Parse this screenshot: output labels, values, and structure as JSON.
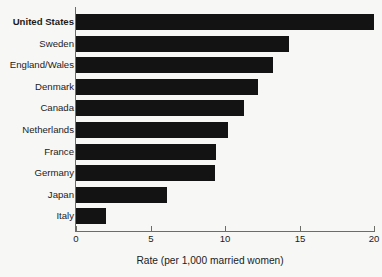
{
  "chart_data": {
    "type": "bar",
    "orientation": "horizontal",
    "title": "",
    "subtitle": "",
    "xlabel": "Rate (per 1,000 married women)",
    "ylabel": "",
    "xlim": [
      0,
      20
    ],
    "xticks": [
      0,
      5,
      10,
      15,
      20
    ],
    "xtick_labels": [
      "0",
      "5",
      "10",
      "15",
      "20"
    ],
    "grid": false,
    "legend": null,
    "bar_color": "#131313",
    "background_color": "#f7f7f5",
    "axis_color": "#6c6c68",
    "categories": [
      "United States",
      "Sweden",
      "England/Wales",
      "Denmark",
      "Canada",
      "Netherlands",
      "France",
      "Germany",
      "Japan",
      "Italy"
    ],
    "values": [
      20.0,
      14.3,
      13.2,
      12.2,
      11.3,
      10.2,
      9.4,
      9.3,
      6.1,
      2.0
    ],
    "highlighted_category": "United States",
    "bars": [
      {
        "label": "United States",
        "value": 20.0,
        "emphasis": "bold"
      },
      {
        "label": "Sweden",
        "value": 14.3,
        "emphasis": "normal"
      },
      {
        "label": "England/Wales",
        "value": 13.2,
        "emphasis": "normal"
      },
      {
        "label": "Denmark",
        "value": 12.2,
        "emphasis": "normal"
      },
      {
        "label": "Canada",
        "value": 11.3,
        "emphasis": "normal"
      },
      {
        "label": "Netherlands",
        "value": 10.2,
        "emphasis": "normal"
      },
      {
        "label": "France",
        "value": 9.4,
        "emphasis": "normal"
      },
      {
        "label": "Germany",
        "value": 9.3,
        "emphasis": "normal"
      },
      {
        "label": "Japan",
        "value": 6.1,
        "emphasis": "normal"
      },
      {
        "label": "Italy",
        "value": 2.0,
        "emphasis": "normal"
      }
    ]
  }
}
